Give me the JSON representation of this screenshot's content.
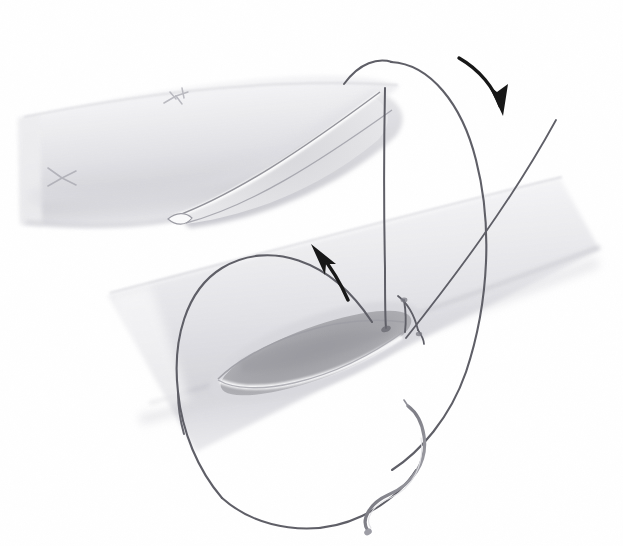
{
  "figure": {
    "caption": "Pencil-and-wash surgical illustration: a beveled graft vessel above, a recipient vessel with a longitudinal arteriotomy below, continuous suture loops slung between them, two directional arrows, and a curved swaged needle.",
    "medium": "graphite and gray wash line drawing",
    "background_color": "#ffffff"
  },
  "palette": {
    "background": "#ffffff",
    "vessel_fill_light": "#f4f4f5",
    "vessel_fill_mid": "#e6e6e8",
    "vessel_shadow": "#cfcfd3",
    "vessel_outline": "#9a9aa0",
    "lumen_interior": "#a8a8ac",
    "lumen_interior_deep": "#909095",
    "intima_highlight": "#fcfcfd",
    "suture_thread": "#5a5a62",
    "suture_thread_light": "#8a8a92",
    "needle_metal": "#8e8e96",
    "needle_highlight": "#d8d8dc",
    "arrow_black": "#161616",
    "knot_gray": "#b2b2b8"
  },
  "elements": {
    "graft_vessel": {
      "name": "graft vessel",
      "description": "Tubular graft entering from the upper left, cut on a long bevel so its oval open end faces down and right toward the recipient vessel.",
      "role": "donor conduit",
      "orientation_degrees": -20,
      "knots": [
        {
          "label": "stay suture knot on graft shoulder",
          "x": 176,
          "y": 99
        },
        {
          "label": "stay suture knot on graft body",
          "x": 60,
          "y": 178
        }
      ]
    },
    "recipient_vessel": {
      "name": "recipient vessel",
      "description": "Larger vessel crossing the lower half diagonally from lower left to upper right, opened by an elliptical arteriotomy whose darker lumen is visible.",
      "role": "host artery",
      "orientation_degrees": -22,
      "arteriotomy": {
        "label": "arteriotomy",
        "center_x": 315,
        "center_y": 352,
        "length": 210,
        "width": 58
      }
    },
    "suture": {
      "name": "continuous polypropylene suture",
      "description": "A single long thread forming a tall loop over the graft tip, a second loop swinging left and below the recipient vessel, with free tails passing into the arteriotomy and a straight tail running off to the upper right.",
      "loops": 2,
      "free_ends": 3
    },
    "needle": {
      "name": "curved swaged needle",
      "description": "Half-circle taper-point needle attached to the suture, lying free at the lower right of the field.",
      "x": 430,
      "y": 470
    },
    "arrows": [
      {
        "id": "arrow-down-right",
        "label": "direction of suture travel over graft tip",
        "direction": "down",
        "tip_x": 502,
        "tip_y": 110,
        "tail_x": 459,
        "tail_y": 58
      },
      {
        "id": "arrow-up-left",
        "label": "direction of suture travel out of arteriotomy",
        "direction": "up-left",
        "tip_x": 313,
        "tip_y": 243,
        "tail_x": 345,
        "tail_y": 297
      }
    ]
  },
  "annotations": {
    "labels": [],
    "text_present": false
  }
}
